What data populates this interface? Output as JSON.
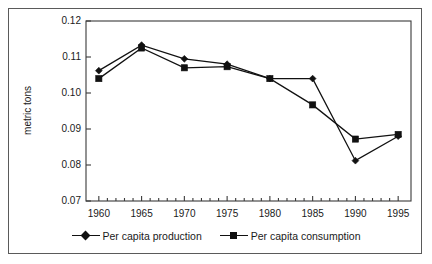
{
  "chart_data": {
    "type": "line",
    "title": "",
    "xlabel": "",
    "ylabel": "metric tons",
    "x": [
      1960,
      1965,
      1970,
      1975,
      1980,
      1985,
      1990,
      1995
    ],
    "xtick_labels": [
      "1960",
      "1965",
      "1970",
      "1975",
      "1980",
      "1985",
      "1990",
      "1995"
    ],
    "ytick_labels": [
      "0.12",
      "0.11",
      "0.10",
      "0.09",
      "0.08",
      "0.07"
    ],
    "ytick_values": [
      0.12,
      0.11,
      0.1,
      0.09,
      0.08,
      0.07
    ],
    "xlim": [
      1958.5,
      1996.5
    ],
    "ylim": [
      0.07,
      0.12
    ],
    "grid": false,
    "legend_position": "bottom-center",
    "minor_xticks": true,
    "minor_xtick_interval": 1,
    "series": [
      {
        "name": "Per capita production",
        "marker": "diamond",
        "color": "#111111",
        "values": [
          0.1062,
          0.1133,
          0.1095,
          0.108,
          0.104,
          0.104,
          0.0812,
          0.088
        ]
      },
      {
        "name": "Per capita consumption",
        "marker": "square",
        "color": "#111111",
        "values": [
          0.104,
          0.1125,
          0.107,
          0.1073,
          0.104,
          0.0967,
          0.0872,
          0.0885
        ]
      }
    ]
  },
  "legend": {
    "entries": [
      {
        "label": "Per capita production",
        "marker": "diamond-marker-icon"
      },
      {
        "label": "Per capita consumption",
        "marker": "square-marker-icon"
      }
    ]
  },
  "axis": {
    "y_title": "metric tons"
  }
}
